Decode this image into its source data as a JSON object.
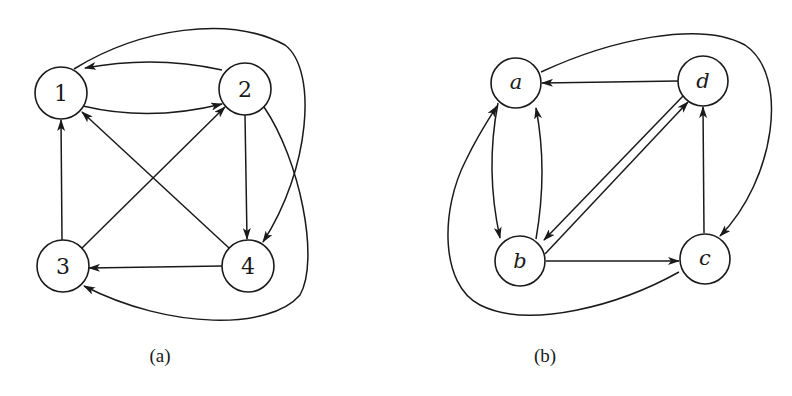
{
  "figure": {
    "panels": [
      {
        "id": "a",
        "caption": "(a)",
        "nodes": [
          {
            "id": "1",
            "label": "1",
            "x": 61,
            "y": 93
          },
          {
            "id": "2",
            "label": "2",
            "x": 245,
            "y": 89
          },
          {
            "id": "3",
            "label": "3",
            "x": 63,
            "y": 266
          },
          {
            "id": "4",
            "label": "4",
            "x": 248,
            "y": 266
          }
        ],
        "edges": [
          {
            "from": "2",
            "to": "1",
            "shape": "arc-upper"
          },
          {
            "from": "1",
            "to": "2",
            "shape": "arc-lower"
          },
          {
            "from": "3",
            "to": "1",
            "shape": "straight"
          },
          {
            "from": "3",
            "to": "2",
            "shape": "straight"
          },
          {
            "from": "4",
            "to": "1",
            "shape": "straight"
          },
          {
            "from": "2",
            "to": "4",
            "shape": "straight"
          },
          {
            "from": "4",
            "to": "3",
            "shape": "straight"
          },
          {
            "from": "1",
            "to": "4",
            "shape": "outer-arc-top-right"
          },
          {
            "from": "2",
            "to": "3",
            "shape": "outer-arc-bottom"
          }
        ]
      },
      {
        "id": "b",
        "caption": "(b)",
        "nodes": [
          {
            "id": "a",
            "label": "a",
            "x": 516,
            "y": 83
          },
          {
            "id": "d",
            "label": "d",
            "x": 703,
            "y": 81
          },
          {
            "id": "b",
            "label": "b",
            "x": 520,
            "y": 261
          },
          {
            "id": "c",
            "label": "c",
            "x": 705,
            "y": 259
          }
        ],
        "edges": [
          {
            "from": "d",
            "to": "a",
            "shape": "straight"
          },
          {
            "from": "a",
            "to": "b",
            "shape": "arc-left"
          },
          {
            "from": "b",
            "to": "a",
            "shape": "arc-right"
          },
          {
            "from": "d",
            "to": "b",
            "shape": "parallel-upper"
          },
          {
            "from": "b",
            "to": "d",
            "shape": "parallel-lower"
          },
          {
            "from": "b",
            "to": "c",
            "shape": "straight"
          },
          {
            "from": "c",
            "to": "d",
            "shape": "straight"
          },
          {
            "from": "a",
            "to": "c",
            "shape": "outer-arc-top-right"
          },
          {
            "from": "c",
            "to": "a",
            "shape": "outer-arc-bottom-left"
          }
        ]
      }
    ]
  }
}
